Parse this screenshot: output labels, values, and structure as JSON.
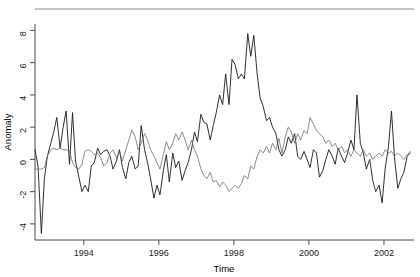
{
  "chart_data": {
    "type": "line",
    "title": "",
    "xlabel": "Time",
    "ylabel": "Anomaly",
    "xlim": [
      1992.7,
      2002.8
    ],
    "ylim": [
      -5.0,
      8.4
    ],
    "grid": false,
    "legend": "none",
    "xticks": [
      1994,
      1996,
      1998,
      2000,
      2002
    ],
    "xtick_labels": [
      "1994",
      "1996",
      "1998",
      "2000",
      "2002"
    ],
    "yticks": [
      -4,
      -2,
      0,
      2,
      4,
      6,
      8
    ],
    "ytick_labels": [
      "-4",
      "-2",
      "0",
      "2",
      "4",
      "6",
      "8"
    ],
    "series": [
      {
        "name": "series-dark",
        "color": "#1a1a1a",
        "width": 0.9,
        "x": [
          1992.7,
          1992.78,
          1992.87,
          1992.95,
          1993.03,
          1993.12,
          1993.2,
          1993.28,
          1993.37,
          1993.45,
          1993.53,
          1993.62,
          1993.7,
          1993.78,
          1993.87,
          1993.95,
          1994.03,
          1994.12,
          1994.2,
          1994.28,
          1994.37,
          1994.45,
          1994.53,
          1994.62,
          1994.7,
          1994.78,
          1994.87,
          1994.95,
          1995.03,
          1995.12,
          1995.2,
          1995.28,
          1995.37,
          1995.45,
          1995.53,
          1995.62,
          1995.7,
          1995.78,
          1995.87,
          1995.95,
          1996.03,
          1996.12,
          1996.2,
          1996.28,
          1996.37,
          1996.45,
          1996.53,
          1996.62,
          1996.7,
          1996.78,
          1996.87,
          1996.95,
          1997.03,
          1997.12,
          1997.2,
          1997.28,
          1997.37,
          1997.45,
          1997.53,
          1997.62,
          1997.7,
          1997.78,
          1997.87,
          1997.95,
          1998.03,
          1998.12,
          1998.2,
          1998.28,
          1998.37,
          1998.45,
          1998.53,
          1998.62,
          1998.7,
          1998.78,
          1998.87,
          1998.95,
          1999.03,
          1999.12,
          1999.2,
          1999.28,
          1999.37,
          1999.45,
          1999.53,
          1999.62,
          1999.7,
          1999.78,
          1999.87,
          1999.95,
          2000.03,
          2000.12,
          2000.2,
          2000.28,
          2000.37,
          2000.45,
          2000.53,
          2000.62,
          2000.7,
          2000.78,
          2000.87,
          2000.95,
          2001.03,
          2001.12,
          2001.2,
          2001.28,
          2001.37,
          2001.45,
          2001.53,
          2001.62,
          2001.7,
          2001.78,
          2001.87,
          2001.95,
          2002.03,
          2002.12,
          2002.2,
          2002.28,
          2002.37,
          2002.45,
          2002.53,
          2002.62,
          2002.7
        ],
        "y": [
          0.6,
          -0.4,
          -4.6,
          -1.2,
          0.2,
          1.0,
          1.7,
          2.6,
          0.7,
          2.0,
          3.0,
          -0.3,
          2.9,
          -0.1,
          -1.1,
          -2.0,
          -1.6,
          -2.0,
          -0.4,
          -0.2,
          0.7,
          0.3,
          0.5,
          0.6,
          0.2,
          -0.6,
          -0.1,
          0.6,
          -0.5,
          -1.2,
          -0.2,
          0.2,
          -0.6,
          -0.4,
          2.1,
          0.6,
          -0.2,
          -1.2,
          -2.4,
          -1.6,
          -2.2,
          -0.7,
          0.3,
          -1.4,
          0.4,
          -0.5,
          -0.1,
          -1.3,
          -0.7,
          -0.2,
          0.6,
          1.7,
          1.1,
          2.8,
          2.3,
          2.2,
          1.2,
          2.1,
          2.9,
          4.0,
          3.4,
          5.3,
          3.4,
          6.2,
          5.9,
          5.0,
          5.3,
          5.0,
          7.8,
          6.4,
          7.7,
          5.3,
          3.8,
          3.3,
          2.4,
          2.6,
          2.0,
          1.6,
          0.6,
          0.2,
          0.6,
          1.4,
          1.0,
          1.6,
          0.2,
          0.0,
          0.5,
          0.0,
          -0.5,
          0.6,
          0.4,
          -1.1,
          -0.7,
          0.0,
          0.6,
          0.2,
          -0.3,
          0.7,
          0.2,
          -0.2,
          0.4,
          1.2,
          0.6,
          4.0,
          1.0,
          0.4,
          -0.6,
          0.0,
          -1.3,
          -2.0,
          -1.6,
          -2.7,
          -0.6,
          0.8,
          3.0,
          0.1,
          -1.8,
          -1.2,
          -0.8,
          0.2,
          0.4
        ]
      },
      {
        "name": "series-light",
        "color": "#6e6e6e",
        "width": 0.8,
        "x": [
          1992.7,
          1992.78,
          1992.87,
          1992.95,
          1993.03,
          1993.12,
          1993.2,
          1993.28,
          1993.37,
          1993.45,
          1993.53,
          1993.62,
          1993.7,
          1993.78,
          1993.87,
          1993.95,
          1994.03,
          1994.12,
          1994.2,
          1994.28,
          1994.37,
          1994.45,
          1994.53,
          1994.62,
          1994.7,
          1994.78,
          1994.87,
          1994.95,
          1995.03,
          1995.12,
          1995.2,
          1995.28,
          1995.37,
          1995.45,
          1995.53,
          1995.62,
          1995.7,
          1995.78,
          1995.87,
          1995.95,
          1996.03,
          1996.12,
          1996.2,
          1996.28,
          1996.37,
          1996.45,
          1996.53,
          1996.62,
          1996.7,
          1996.78,
          1996.87,
          1996.95,
          1997.03,
          1997.12,
          1997.2,
          1997.28,
          1997.37,
          1997.45,
          1997.53,
          1997.62,
          1997.7,
          1997.78,
          1997.87,
          1997.95,
          1998.03,
          1998.12,
          1998.2,
          1998.28,
          1998.37,
          1998.45,
          1998.53,
          1998.62,
          1998.7,
          1998.78,
          1998.87,
          1998.95,
          1999.03,
          1999.12,
          1999.2,
          1999.28,
          1999.37,
          1999.45,
          1999.53,
          1999.62,
          1999.7,
          1999.78,
          1999.87,
          1999.95,
          2000.03,
          2000.12,
          2000.2,
          2000.28,
          2000.37,
          2000.45,
          2000.53,
          2000.62,
          2000.7,
          2000.78,
          2000.87,
          2000.95,
          2001.03,
          2001.12,
          2001.2,
          2001.28,
          2001.37,
          2001.45,
          2001.53,
          2001.62,
          2001.7,
          2001.78,
          2001.87,
          2001.95,
          2002.03,
          2002.12,
          2002.2,
          2002.28,
          2002.37,
          2002.45,
          2002.53,
          2002.62,
          2002.7
        ],
        "y": [
          -0.6,
          -0.6,
          -0.6,
          -0.5,
          0.2,
          0.6,
          0.7,
          0.6,
          0.7,
          0.6,
          0.6,
          0.5,
          -0.2,
          -0.5,
          -0.6,
          -0.3,
          0.5,
          0.6,
          0.5,
          0.3,
          0.4,
          0.1,
          -0.4,
          -0.2,
          0.4,
          0.6,
          0.1,
          0.5,
          -0.1,
          0.6,
          1.2,
          1.8,
          1.4,
          0.6,
          1.0,
          1.6,
          1.2,
          0.6,
          0.2,
          -0.2,
          -0.6,
          0.3,
          1.1,
          0.6,
          1.0,
          1.6,
          1.2,
          1.7,
          1.2,
          0.6,
          1.2,
          0.6,
          0.2,
          -0.6,
          -1.0,
          -1.2,
          -0.8,
          -1.4,
          -1.3,
          -1.7,
          -1.4,
          -1.6,
          -2.0,
          -1.8,
          -1.6,
          -1.8,
          -1.5,
          -1.0,
          -1.2,
          -0.4,
          -0.6,
          0.2,
          0.6,
          0.4,
          0.8,
          0.4,
          1.0,
          0.6,
          1.3,
          0.4,
          1.4,
          2.0,
          1.7,
          1.0,
          1.6,
          1.2,
          1.8,
          1.6,
          2.6,
          2.2,
          1.8,
          1.6,
          1.4,
          1.0,
          1.2,
          0.8,
          1.0,
          0.6,
          0.8,
          0.4,
          0.6,
          0.2,
          0.6,
          0.4,
          0.2,
          0.6,
          0.2,
          0.4,
          0.0,
          0.2,
          0.4,
          0.2,
          0.6,
          0.4,
          0.5,
          0.2,
          0.4,
          0.2,
          0.0,
          0.3,
          0.5
        ]
      }
    ]
  }
}
